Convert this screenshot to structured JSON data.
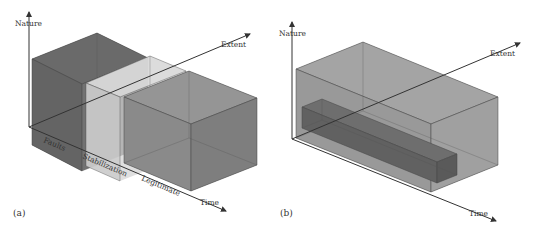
{
  "figure": {
    "panel_a": {
      "tag": "(a)",
      "axes": {
        "nature_label": "Nature",
        "extent_label": "Extent",
        "time_label": "Time"
      },
      "phases": [
        {
          "name": "Faults",
          "shade": "#6f6f6f",
          "opacity": 0.9
        },
        {
          "name": "Stabilization",
          "shade": "#c8c8c8",
          "opacity": 0.75
        },
        {
          "name": "Legitimate",
          "shade": "#8e8e8e",
          "opacity": 0.85
        }
      ]
    },
    "panel_b": {
      "tag": "(b)",
      "axes": {
        "nature_label": "Nature",
        "extent_label": "Extent",
        "time_label": "Time"
      },
      "outer_box_shade": "#9a9a9a",
      "inner_bar_shade": "#666666"
    }
  }
}
